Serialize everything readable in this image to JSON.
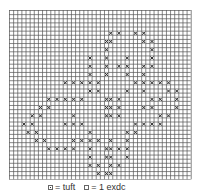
{
  "chart_data": {
    "type": "heatmap",
    "title": "",
    "grid": {
      "cols": 44,
      "rows": 41,
      "cell_px": 4.13,
      "line_color": "#555555",
      "mark_color": "#333333"
    },
    "marks": [
      {
        "row": 5,
        "cols": [
          24,
          26,
          30,
          32
        ]
      },
      {
        "row": 7,
        "cols": [
          23,
          24,
          32,
          34
        ]
      },
      {
        "row": 9,
        "cols": [
          23,
          34
        ]
      },
      {
        "row": 11,
        "cols": [
          19,
          23,
          28,
          34
        ]
      },
      {
        "row": 13,
        "cols": [
          19,
          23,
          26,
          28,
          32,
          34
        ]
      },
      {
        "row": 15,
        "cols": [
          19,
          23,
          28,
          32
        ]
      },
      {
        "row": 17,
        "cols": [
          13,
          15,
          17,
          19,
          21,
          30,
          32,
          34,
          36,
          38
        ]
      },
      {
        "row": 19,
        "cols": [
          19,
          21,
          28,
          32,
          38,
          40
        ]
      },
      {
        "row": 21,
        "cols": [
          9,
          11,
          13,
          15,
          17,
          23,
          24,
          26,
          34,
          36,
          40
        ]
      },
      {
        "row": 23,
        "cols": [
          7,
          9,
          23,
          24,
          26,
          32,
          34,
          40
        ]
      },
      {
        "row": 25,
        "cols": [
          5,
          7,
          15,
          23,
          24,
          26,
          36,
          38
        ]
      },
      {
        "row": 27,
        "cols": [
          3,
          5,
          13,
          15,
          17,
          30,
          32,
          34,
          36
        ]
      },
      {
        "row": 29,
        "cols": [
          4,
          6,
          19,
          28,
          30
        ]
      },
      {
        "row": 31,
        "cols": [
          6,
          8,
          15,
          17,
          19,
          21,
          24,
          28
        ]
      },
      {
        "row": 33,
        "cols": [
          9,
          11,
          13,
          15,
          19,
          23,
          24,
          26,
          28
        ]
      },
      {
        "row": 35,
        "cols": [
          19,
          23,
          24,
          28
        ]
      },
      {
        "row": 37,
        "cols": [
          19,
          21,
          24,
          26
        ]
      },
      {
        "row": 39,
        "cols": [
          21,
          23,
          24
        ]
      }
    ],
    "legend": [
      {
        "symbol": "tuft-cell",
        "label": "= tuft"
      },
      {
        "symbol": "empty-cell",
        "label": "= 1 exdc"
      }
    ]
  },
  "legend": {
    "tuft_label": "= tuft",
    "exdc_label": "= 1 exdc"
  }
}
